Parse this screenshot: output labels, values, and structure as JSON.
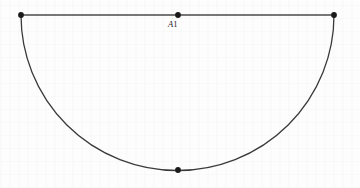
{
  "figure": {
    "name": "semicircle-with-diameter",
    "label_a1": "A1",
    "label_a1_italic_part": "A",
    "label_a1_roman_part": "1",
    "colors": {
      "background": "#fdfdfd",
      "chord_line": "#4a4a4a",
      "arc_line": "#3a3a3a",
      "vertex_dot": "#1a1a1a",
      "label_text": "#1c1c1c"
    },
    "geometry": {
      "type": "semicircle",
      "chord_y": 15,
      "left_endpoint": {
        "x": 21,
        "y": 15
      },
      "right_endpoint": {
        "x": 334,
        "y": 15
      },
      "top_center_point": {
        "x": 178,
        "y": 15
      },
      "bottom_point": {
        "x": 178,
        "y": 170
      },
      "center": {
        "x": 178,
        "y": 15
      },
      "radius_x": 156,
      "radius_y": 155,
      "dot_radius": 2.9,
      "chord_stroke_width": 1.5,
      "arc_stroke_width": 1.3
    }
  }
}
